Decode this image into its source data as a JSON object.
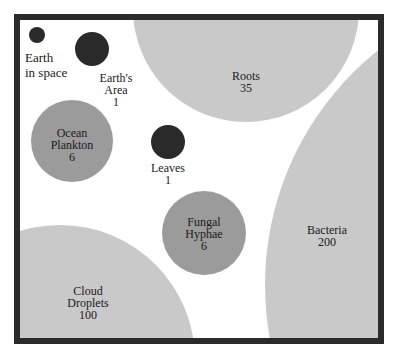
{
  "diagram": {
    "colors": {
      "frame": "#2b2b2b",
      "large": "#c9c9c9",
      "medium": "#9b9b9b",
      "small": "#2a2a2a"
    },
    "items": [
      {
        "id": "earth-in-space",
        "lines": [
          "Earth",
          "in space"
        ],
        "value": ""
      },
      {
        "id": "earths-area",
        "lines": [
          "Earth's",
          "Area"
        ],
        "value": "1"
      },
      {
        "id": "roots",
        "lines": [
          "Roots"
        ],
        "value": "35"
      },
      {
        "id": "ocean-plankton",
        "lines": [
          "Ocean",
          "Plankton"
        ],
        "value": "6"
      },
      {
        "id": "leaves",
        "lines": [
          "Leaves"
        ],
        "value": "1"
      },
      {
        "id": "fungal-hyphae",
        "lines": [
          "Fungal",
          "Hyphae"
        ],
        "value": "6"
      },
      {
        "id": "bacteria",
        "lines": [
          "Bacteria"
        ],
        "value": "200"
      },
      {
        "id": "cloud-droplets",
        "lines": [
          "Cloud",
          "Droplets"
        ],
        "value": "100"
      }
    ]
  }
}
